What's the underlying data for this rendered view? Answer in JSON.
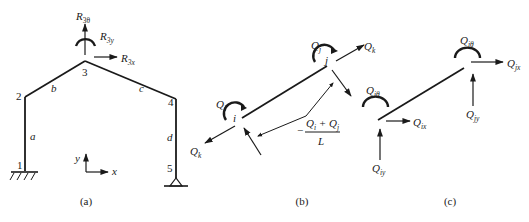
{
  "panels": {
    "a": {
      "caption": "(a)",
      "nodes": [
        "1",
        "2",
        "3",
        "4",
        "5"
      ],
      "members": [
        "a",
        "b",
        "c",
        "d"
      ],
      "reactions": {
        "theta": {
          "base": "R",
          "sub": "3θ"
        },
        "y": {
          "base": "R",
          "sub": "3y"
        },
        "x": {
          "base": "R",
          "sub": "3x"
        }
      },
      "axes": {
        "x": "x",
        "y": "y"
      }
    },
    "b": {
      "caption": "(b)",
      "node_i": "i",
      "node_j": "j",
      "moment_i": {
        "base": "Q",
        "sub": "i"
      },
      "moment_j": {
        "base": "Q",
        "sub": "j"
      },
      "axial_j": {
        "base": "Q",
        "sub": "k"
      },
      "axial_i": {
        "base": "Q",
        "sub": "k"
      },
      "shear_label": {
        "sign": "−",
        "numerator": "Q",
        "num_sub_1": "i",
        "plus": " + Q",
        "num_sub_2": "j",
        "denominator": "L"
      }
    },
    "c": {
      "caption": "(c)",
      "i_theta": {
        "base": "Q",
        "sub": "iθ"
      },
      "i_x": {
        "base": "Q",
        "sub": "ix"
      },
      "i_y": {
        "base": "Q",
        "sub": "iy"
      },
      "j_theta": {
        "base": "Q",
        "sub": "jθ"
      },
      "j_x": {
        "base": "Q",
        "sub": "jx"
      },
      "j_y": {
        "base": "Q",
        "sub": "jy"
      }
    }
  }
}
